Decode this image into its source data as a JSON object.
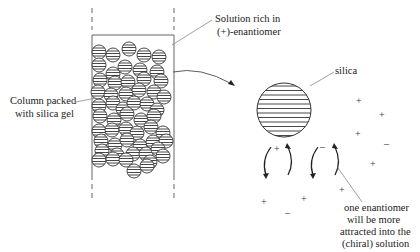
{
  "labels": {
    "solution_line1": "Solution rich in",
    "solution_line2": "(+)-enantiomer",
    "column_line1": "Column packed",
    "column_line2": "with silica gel",
    "silica": "silica",
    "note_line1": "one enantiomer",
    "note_line2": "will be more",
    "note_line3": "attracted into the",
    "note_line4": "(chiral) solution"
  },
  "symbols": {
    "plus": "+",
    "minus": "–"
  },
  "colors": {
    "stroke": "#333333",
    "leader": "#777777"
  }
}
